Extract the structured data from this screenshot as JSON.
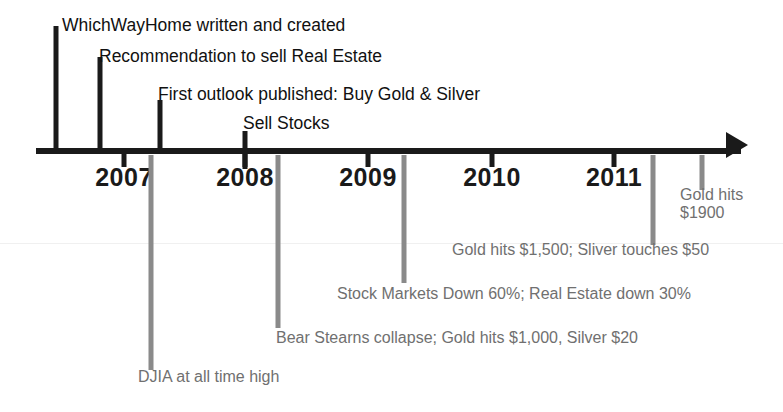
{
  "figure": {
    "type": "timeline",
    "orientation": "horizontal-left-to-right",
    "axis": {
      "start_x": 36,
      "end_x": 745,
      "arrow": "right-arrowhead",
      "color": "#1a1a1a"
    },
    "accent_colors": {
      "axis_and_top_events": "#1a1a1a",
      "bottom_events": "#8a8a8a",
      "background": "#ffffff"
    }
  },
  "year_ticks": [
    {
      "label": "2007",
      "x": 124
    },
    {
      "label": "2008",
      "x": 245
    },
    {
      "label": "2009",
      "x": 368
    },
    {
      "label": "2010",
      "x": 492
    },
    {
      "label": "2011",
      "x": 614
    }
  ],
  "events_above": [
    {
      "label": "WhichWayHome written and created",
      "marker_x": 56,
      "stem_top": 26,
      "stem_height": 124,
      "text_x": 62,
      "text_y": 15
    },
    {
      "label": "Recommendation to sell Real Estate",
      "marker_x": 100,
      "stem_top": 57,
      "stem_height": 93,
      "text_x": 99,
      "text_y": 46
    },
    {
      "label": "First outlook published: Buy Gold & Silver",
      "marker_x": 160,
      "stem_top": 100,
      "stem_height": 50,
      "text_x": 158,
      "text_y": 84
    },
    {
      "label": "Sell Stocks",
      "marker_x": 245,
      "stem_top": 131,
      "stem_height": 38,
      "text_x": 243,
      "text_y": 113
    }
  ],
  "events_below": [
    {
      "label": "DJIA at all time high",
      "marker_x": 151,
      "stem_top": 155,
      "stem_height": 215,
      "text_x": 138,
      "text_y": 368
    },
    {
      "label": "Bear Stearns collapse; Gold hits $1,000, Silver $20",
      "marker_x": 278,
      "stem_top": 155,
      "stem_height": 173,
      "text_x": 276,
      "text_y": 329
    },
    {
      "label": "Stock Markets Down 60%; Real Estate down 30%",
      "marker_x": 404,
      "stem_top": 155,
      "stem_height": 128,
      "text_x": 337,
      "text_y": 285
    },
    {
      "label": "Gold hits $1,500; Sliver touches $50",
      "marker_x": 653,
      "stem_top": 155,
      "stem_height": 90,
      "text_x": 452,
      "text_y": 241
    },
    {
      "label_line1": "Gold hits",
      "label_line2": "$1900",
      "marker_x": 702,
      "stem_top": 155,
      "stem_height": 35,
      "text_x": 680,
      "text_y": 186
    }
  ]
}
